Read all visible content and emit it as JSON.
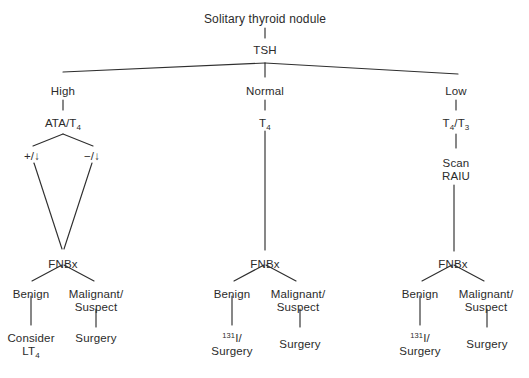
{
  "diagram": {
    "title": "Solitary thyroid nodule",
    "type": "clinical decision tree",
    "root": {
      "id": "root",
      "label": "Solitary thyroid nodule",
      "x": 265,
      "y": 13
    },
    "nodes": [
      {
        "id": "tsh",
        "label": "TSH",
        "x": 265,
        "y": 44,
        "wrap": false
      },
      {
        "id": "high",
        "label": "High",
        "x": 63,
        "y": 85,
        "wrap": false
      },
      {
        "id": "normal",
        "label": "Normal",
        "x": 265,
        "y": 85,
        "wrap": false
      },
      {
        "id": "low",
        "label": "Low",
        "x": 456,
        "y": 85,
        "wrap": false
      },
      {
        "id": "ata-t4",
        "label": "ATA/T",
        "sub": "4",
        "x": 63,
        "y": 117,
        "wrap": false
      },
      {
        "id": "t4",
        "label": "T",
        "sub": "4",
        "x": 265,
        "y": 117,
        "wrap": false
      },
      {
        "id": "t4-t3",
        "label": "T",
        "sub": "4",
        "label2": "/T",
        "sub2": "3",
        "x": 456,
        "y": 117,
        "wrap": false
      },
      {
        "id": "pos-down",
        "label": "+/↓",
        "x": 32,
        "y": 150,
        "wrap": false
      },
      {
        "id": "neg-down",
        "label": "−/↓",
        "x": 92,
        "y": 150,
        "wrap": false
      },
      {
        "id": "scan-raiu",
        "label": "Scan\nRAIU",
        "x": 456,
        "y": 157,
        "wrap": false
      },
      {
        "id": "fnbx-left",
        "label": "FNBx",
        "x": 63,
        "y": 258,
        "wrap": false
      },
      {
        "id": "fnbx-mid",
        "label": "FNBx",
        "x": 265,
        "y": 258,
        "wrap": false
      },
      {
        "id": "fnbx-right",
        "label": "FNBx",
        "x": 453,
        "y": 258,
        "wrap": false
      },
      {
        "id": "benign-left",
        "label": "Benign",
        "x": 31,
        "y": 288,
        "wrap": false
      },
      {
        "id": "malig-left",
        "label": "Malignant/\nSuspect",
        "x": 96,
        "y": 288,
        "wrap": false
      },
      {
        "id": "benign-mid",
        "label": "Benign",
        "x": 232,
        "y": 288,
        "wrap": false
      },
      {
        "id": "malig-mid",
        "label": "Malignant/\nSuspect",
        "x": 298,
        "y": 288,
        "wrap": false
      },
      {
        "id": "benign-right",
        "label": "Benign",
        "x": 420,
        "y": 288,
        "wrap": false
      },
      {
        "id": "malig-right",
        "label": "Malignant/\nSuspect",
        "x": 486,
        "y": 288,
        "wrap": false
      },
      {
        "id": "consider-lt4",
        "label": "Consider\nLT",
        "sub": "4",
        "x": 31,
        "y": 338,
        "wrap": false
      },
      {
        "id": "surgery-left",
        "label": "Surgery",
        "x": 96,
        "y": 338,
        "wrap": false
      },
      {
        "id": "i131-mid",
        "sup": "131",
        "label": "I/\nSurgery",
        "x": 232,
        "y": 338,
        "wrap": false
      },
      {
        "id": "surgery-mid",
        "label": "Surgery",
        "x": 300,
        "y": 338,
        "wrap": false
      },
      {
        "id": "i131-right",
        "sup": "131",
        "label": "I/\nSurgery",
        "x": 420,
        "y": 338,
        "wrap": false
      },
      {
        "id": "surgery-right",
        "label": "Surgery",
        "x": 487,
        "y": 338,
        "wrap": false
      }
    ],
    "labels": {
      "root": "Solitary thyroid nodule",
      "tsh": "TSH",
      "high": "High",
      "normal": "Normal",
      "low": "Low",
      "ata_t4_base": "ATA/T",
      "ata_t4_sub": "4",
      "t4_base": "T",
      "t4_sub": "4",
      "t4_t3_base": "T",
      "t4_t3_sub1": "4",
      "t4_t3_mid": "/T",
      "t4_t3_sub2": "3",
      "pos_down": "+/↓",
      "neg_down": "−/↓",
      "scan": "Scan",
      "raiu": "RAIU",
      "fnbx": "FNBx",
      "benign": "Benign",
      "malignant_line1": "Malignant/",
      "malignant_line2": "Suspect",
      "consider": "Consider",
      "lt4_base": "LT",
      "lt4_sub": "4",
      "surgery": "Surgery",
      "i131_sup": "131",
      "i131_base": "I/"
    },
    "edges": [
      {
        "from": "root",
        "to": "tsh",
        "d": "M265,28 L265,38"
      },
      {
        "from": "tsh",
        "to": "high",
        "d": "M265,63 L63,72"
      },
      {
        "from": "tsh",
        "to": "normal",
        "d": "M265,63 L265,77"
      },
      {
        "from": "tsh",
        "to": "low",
        "d": "M265,63 L458,74"
      },
      {
        "from": "high",
        "to": "ata-t4",
        "d": "M63,100 L63,110"
      },
      {
        "from": "normal",
        "to": "t4",
        "d": "M265,100 L265,110"
      },
      {
        "from": "low",
        "to": "t4-t3",
        "d": "M456,100 L456,110"
      },
      {
        "from": "ata-t4",
        "to": "pos-down",
        "d": "M63,134 L33,146"
      },
      {
        "from": "ata-t4",
        "to": "neg-down",
        "d": "M63,134 L93,146"
      },
      {
        "from": "t4",
        "to": "fnbx-mid",
        "d": "M265,131 L265,250"
      },
      {
        "from": "t4-t3",
        "to": "scan-raiu",
        "d": "M456,134 L456,148"
      },
      {
        "from": "pos-down",
        "to": "fnbx-left",
        "d": "M34,163 L62,249"
      },
      {
        "from": "neg-down",
        "to": "fnbx-left",
        "d": "M92,163 L64,249"
      },
      {
        "from": "scan-raiu",
        "to": "fnbx-right",
        "d": "M454,185 L454,251"
      },
      {
        "from": "fnbx-left",
        "to": "benign-left",
        "d": "M62,265 L32,281"
      },
      {
        "from": "fnbx-left",
        "to": "malig-left",
        "d": "M64,265 L94,281"
      },
      {
        "from": "fnbx-mid",
        "to": "benign-mid",
        "d": "M264,265 L234,281"
      },
      {
        "from": "fnbx-mid",
        "to": "malig-mid",
        "d": "M266,265 L296,281"
      },
      {
        "from": "fnbx-right",
        "to": "benign-right",
        "d": "M452,265 L422,281"
      },
      {
        "from": "fnbx-right",
        "to": "malig-right",
        "d": "M454,265 L484,281"
      },
      {
        "from": "benign-left",
        "to": "consider-lt4",
        "d": "M31,296 L31,325"
      },
      {
        "from": "malig-left",
        "to": "surgery-left",
        "d": "M96,309 L96,327"
      },
      {
        "from": "benign-mid",
        "to": "i131-mid",
        "d": "M232,296 L232,325"
      },
      {
        "from": "malig-mid",
        "to": "surgery-mid",
        "d": "M300,309 L300,327"
      },
      {
        "from": "benign-right",
        "to": "i131-right",
        "d": "M420,296 L420,325"
      },
      {
        "from": "malig-right",
        "to": "surgery-right",
        "d": "M487,309 L487,327"
      }
    ],
    "style": {
      "line_color": "#2f2f2f",
      "text_color": "#2b2b2b",
      "background": "#ffffff"
    }
  }
}
